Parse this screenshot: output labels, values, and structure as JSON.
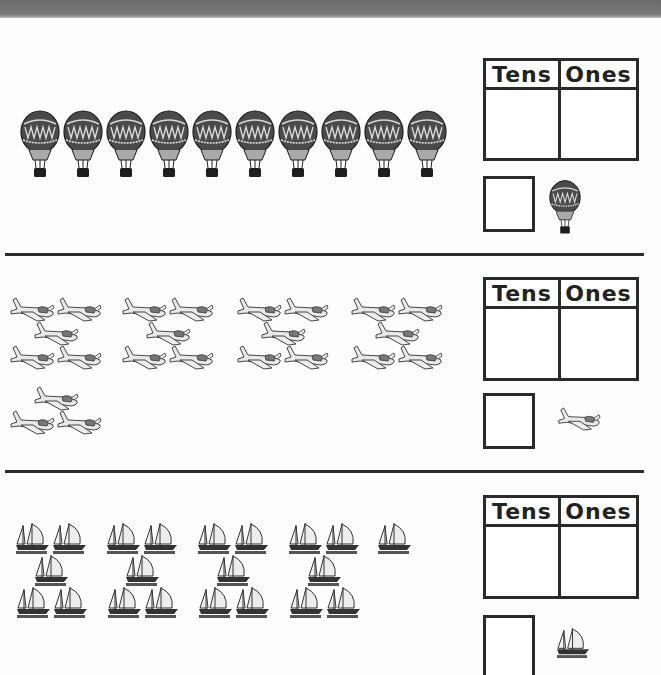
{
  "worksheet": {
    "sections": [
      {
        "object": "hot-air-balloon",
        "count": 10,
        "arrangement": "single row of 10",
        "place_value_table": {
          "tens_label": "Tens",
          "ones_label": "Ones",
          "tens_value": "",
          "ones_value": ""
        },
        "answer_box_value": ""
      },
      {
        "object": "airplane",
        "count": 23,
        "arrangement": "4 groups of 5 (2-1-2) and 1 group of 3 (1-2)",
        "place_value_table": {
          "tens_label": "Tens",
          "ones_label": "Ones",
          "tens_value": "",
          "ones_value": ""
        },
        "answer_box_value": ""
      },
      {
        "object": "sailboat",
        "count": 21,
        "arrangement": "4 groups of 5 (2-1-2) and 1 single",
        "place_value_table": {
          "tens_label": "Tens",
          "ones_label": "Ones",
          "tens_value": "",
          "ones_value": ""
        },
        "answer_box_value": ""
      }
    ]
  },
  "colors": {
    "line": "#2a2a2a",
    "balloon": "#4a4a4a",
    "plane": "#e6e6e6",
    "boat": "#333333",
    "topbar": "#707070"
  }
}
